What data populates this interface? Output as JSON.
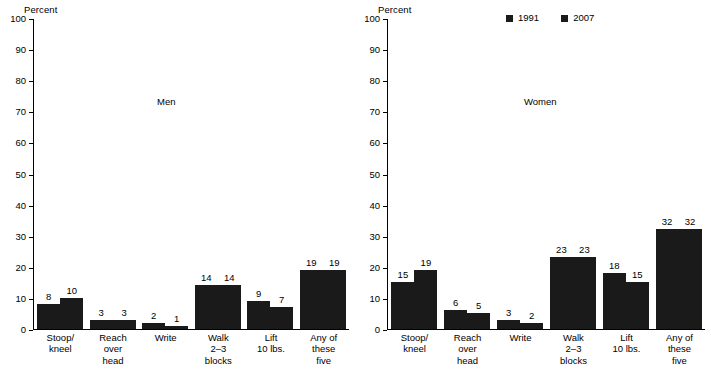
{
  "chart_data": {
    "type": "bar",
    "title": "",
    "ylabel": "Percent",
    "xlabel": "",
    "ylim": [
      0,
      100
    ],
    "yticks": [
      0,
      10,
      20,
      30,
      40,
      50,
      60,
      70,
      80,
      90,
      100
    ],
    "grid": false,
    "legend_position": "top-right-panel",
    "legend": [
      "1991",
      "2007"
    ],
    "categories": [
      "Stoop/\nkneel",
      "Reach\nover\nhead",
      "Write",
      "Walk\n2–3\nblocks",
      "Lift\n10 lbs.",
      "Any of\nthese\nfive"
    ],
    "panels": [
      {
        "name": "Men",
        "series": [
          {
            "name": "1991",
            "values": [
              8,
              3,
              2,
              14,
              9,
              19
            ]
          },
          {
            "name": "2007",
            "values": [
              10,
              3,
              1,
              14,
              7,
              19
            ]
          }
        ]
      },
      {
        "name": "Women",
        "series": [
          {
            "name": "1991",
            "values": [
              15,
              6,
              3,
              23,
              18,
              32
            ]
          },
          {
            "name": "2007",
            "values": [
              19,
              5,
              2,
              23,
              15,
              32
            ]
          }
        ]
      }
    ],
    "colors": {
      "bar": "#1a1a1a",
      "axis": "#000000",
      "background": "#ffffff",
      "text": "#000000"
    }
  }
}
